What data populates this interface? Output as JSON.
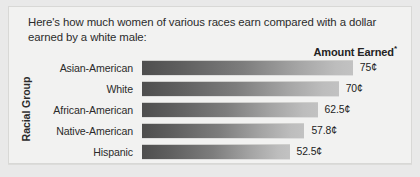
{
  "headline": {
    "line1": "Here's how much women of various races earn compared with a dollar",
    "line2": "earned by a white male:"
  },
  "column_header": {
    "label": "Amount Earned",
    "footnote_marker": "*"
  },
  "axis": {
    "y_label": "Racial Group"
  },
  "colors": {
    "page_background": "#e9e9e9",
    "panel_background": "#f2f2f1",
    "panel_border": "#d8d8d6",
    "text": "#2b2b2b",
    "bar_dark": "#4e4e4e",
    "bar_light": "#c2c2c2"
  },
  "chart_data": {
    "type": "bar",
    "orientation": "horizontal",
    "title": "Here's how much women of various races earn compared with a dollar earned by a white male:",
    "xlabel": "Amount Earned",
    "ylabel": "Racial Group",
    "grid": false,
    "legend": "none",
    "xlim": [
      0,
      100
    ],
    "unit": "cents per dollar earned by a white male",
    "categories": [
      "Asian-American",
      "White",
      "African-American",
      "Native-American",
      "Hispanic"
    ],
    "values": [
      75,
      70,
      62.5,
      57.8,
      52.5
    ],
    "value_labels": [
      "75¢",
      "70¢",
      "62.5¢",
      "57.8¢",
      "52.5¢"
    ],
    "bars": [
      {
        "category": "Asian-American",
        "value": 75,
        "label": "75¢"
      },
      {
        "category": "White",
        "value": 70,
        "label": "70¢"
      },
      {
        "category": "African-American",
        "value": 62.5,
        "label": "62.5¢"
      },
      {
        "category": "Native-American",
        "value": 57.8,
        "label": "57.8¢"
      },
      {
        "category": "Hispanic",
        "value": 52.5,
        "label": "52.5¢"
      }
    ]
  }
}
